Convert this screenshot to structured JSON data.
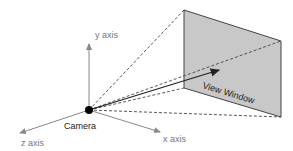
{
  "diagram": {
    "labels": {
      "y_axis": "y axis",
      "z_axis": "z axis",
      "x_axis": "x axis",
      "camera": "Camera",
      "view_window": "View Window"
    },
    "colors": {
      "window_fill": "#c8c8c8",
      "window_stroke": "#444444",
      "axis": "#888888",
      "dashed": "#444444",
      "camera_dot": "#000000"
    }
  }
}
